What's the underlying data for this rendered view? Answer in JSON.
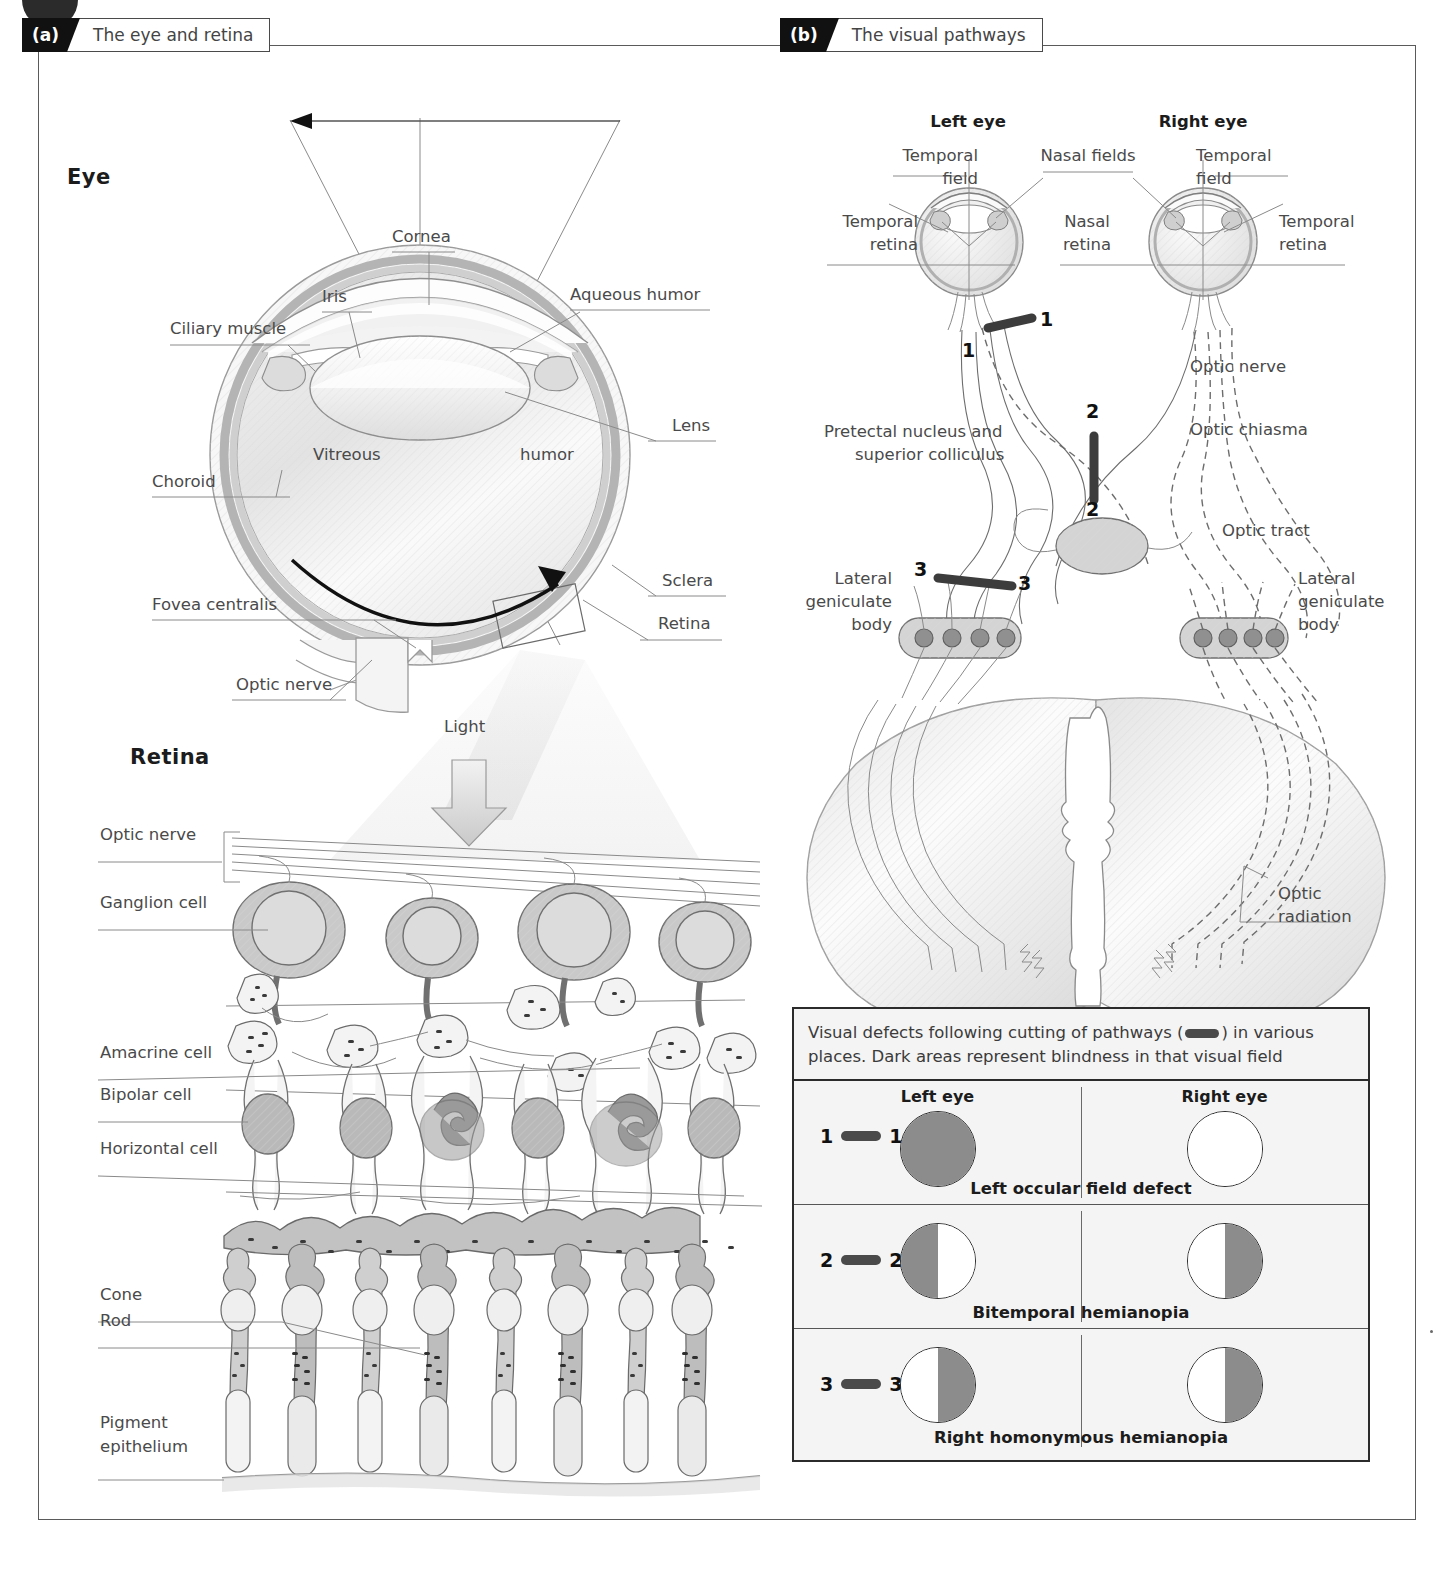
{
  "panels": {
    "a": {
      "tag": "(a)",
      "title": "The eye and retina"
    },
    "b": {
      "tag": "(b)",
      "title": "The visual pathways"
    }
  },
  "eye_section": {
    "heading": "Eye",
    "labels": {
      "cornea": "Cornea",
      "iris": "Iris",
      "ciliary_muscle": "Ciliary muscle",
      "aqueous_humor": "Aqueous humor",
      "lens": "Lens",
      "choroid": "Choroid",
      "vitreous": "Vitreous",
      "humor": "humor",
      "sclera": "Sclera",
      "retina": "Retina",
      "fovea_centralis": "Fovea centralis",
      "optic_nerve": "Optic nerve"
    }
  },
  "light_arrow": {
    "label": "Light"
  },
  "retina_section": {
    "heading": "Retina",
    "labels": {
      "optic_nerve": "Optic nerve",
      "ganglion_cell": "Ganglion cell",
      "amacrine_cell": "Amacrine cell",
      "bipolar_cell": "Bipolar cell",
      "horizontal_cell": "Horizontal cell",
      "cone": "Cone",
      "rod": "Rod",
      "pigment_epithelium": "Pigment\nepithelium",
      "pigment_epithelium_l1": "Pigment",
      "pigment_epithelium_l2": "epithelium"
    }
  },
  "pathways": {
    "left_eye": "Left eye",
    "right_eye": "Right eye",
    "nasal_fields": "Nasal fields",
    "temporal_field_l1": "Temporal",
    "temporal_field_l2": "field",
    "temporal_retina_l1": "Temporal",
    "temporal_retina_l2": "retina",
    "nasal_retina_l1": "Nasal",
    "nasal_retina_l2": "retina",
    "optic_nerve": "Optic nerve",
    "optic_chiasma": "Optic chiasma",
    "optic_tract": "Optic tract",
    "optic_radiation_l1": "Optic",
    "optic_radiation_l2": "radiation",
    "pretectal_l1": "Pretectal nucleus and",
    "pretectal_l2": "superior colliculus",
    "lgb_l1": "Lateral",
    "lgb_l2": "geniculate",
    "lgb_l3": "body",
    "primary_visual_cortex": "Primary visual cortex",
    "cut_numbers": [
      "1",
      "1",
      "2",
      "2",
      "3",
      "3"
    ]
  },
  "defect_legend": {
    "caption_part1": "Visual defects following cutting of pathways (",
    "caption_part2": ") in various places. Dark areas represent blindness in that visual field",
    "col_left": "Left eye",
    "col_right": "Right eye",
    "dark_color": "#8c8c8c",
    "rows": [
      {
        "number": "1",
        "left_fill": "dark-full",
        "right_fill": "white-full",
        "name": "Left occular field defect"
      },
      {
        "number": "2",
        "left_fill": "dark-left",
        "right_fill": "dark-right",
        "name": "Bitemporal hemianopia"
      },
      {
        "number": "3",
        "left_fill": "dark-right",
        "right_fill": "dark-right",
        "name": "Right homonymous hemianopia"
      }
    ]
  }
}
